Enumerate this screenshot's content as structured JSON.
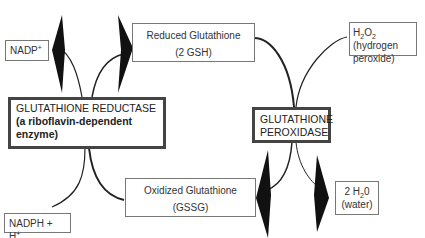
{
  "diagram": {
    "nodes": {
      "nadp": {
        "label": "NADP",
        "sup": "+"
      },
      "nadph": {
        "label": "NADPH + H",
        "sup": "+"
      },
      "reduced_gsh": {
        "line1": "Reduced Glutathione",
        "line2": "(2 GSH)"
      },
      "oxidized_gssg": {
        "line1": "Oxidized Glutathione",
        "line2": "(GSSG)"
      },
      "h2o2": {
        "pre": "H",
        "sub1": "2",
        "mid": "O",
        "sub2": "2",
        "post": " (hydrogen",
        "line2": "peroxide)"
      },
      "water": {
        "pre": "2 H",
        "sub": "2",
        "post": "0",
        "line2": "(water)"
      }
    },
    "enzymes": {
      "reductase": {
        "name": "GLUTATHIONE REDUCTASE",
        "note": "(a riboflavin-dependent enzyme)"
      },
      "peroxidase": {
        "line1": "GLUTATHIONE",
        "line2": "PEROXIDASE"
      }
    },
    "colors": {
      "arrow": "#111111",
      "box_border": "#777777",
      "enzyme_border": "#444444",
      "text": "#333333"
    }
  }
}
